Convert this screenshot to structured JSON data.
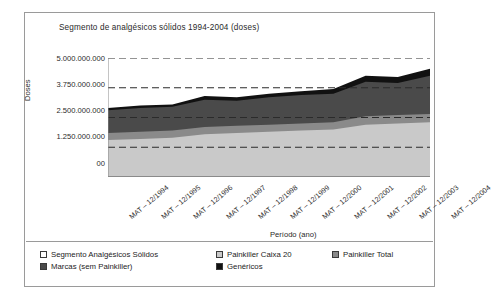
{
  "chart": {
    "title": "Segmento de analgésicos sólidos 1994-2004 (doses)",
    "y_axis_label": "Doses",
    "x_axis_label": "Período (ano)"
  },
  "legend": {
    "items": [
      {
        "label": "Segmento Analgésicos Sólidos",
        "color": "#ffffff"
      },
      {
        "label": "Painkiller Caixa 20",
        "color": "#c9c9c9"
      },
      {
        "label": "Painkiller Total",
        "color": "#8a8a8a"
      },
      {
        "label": "Marcas (sem Painkiller)",
        "color": "#4a4a4a"
      },
      {
        "label": "Genéricos",
        "color": "#111111"
      }
    ]
  },
  "chart_data": {
    "type": "area",
    "title": "Segmento de analgésicos sólidos 1994-2004 (doses)",
    "xlabel": "Período (ano)",
    "ylabel": "Doses",
    "stacked": true,
    "grid": "horizontal-dashed",
    "legend_position": "bottom",
    "ylim": [
      0,
      5000000000
    ],
    "ytick_labels": [
      "5.000.000.000",
      "3.750.000.000",
      "2.500.000.000",
      "1.250.000.000",
      "00"
    ],
    "ytick_values": [
      5000000000,
      3750000000,
      2500000000,
      1250000000,
      0
    ],
    "categories": [
      "MAT – 12/1994",
      "MAT – 12/1995",
      "MAT – 12/1996",
      "MAT – 12/1997",
      "MAT – 12/1998",
      "MAT – 12/1999",
      "MAT – 12/2000",
      "MAT – 12/2001",
      "MAT – 12/2002",
      "MAT – 12/2003",
      "MAT – 12/2004"
    ],
    "series": [
      {
        "name": "Painkiller Caixa 20",
        "color": "#c9c9c9",
        "values": [
          1550000000,
          1600000000,
          1650000000,
          1800000000,
          1850000000,
          1900000000,
          1950000000,
          2000000000,
          2200000000,
          2250000000,
          2300000000
        ]
      },
      {
        "name": "Painkiller Total",
        "color": "#8a8a8a",
        "values": [
          300000000,
          300000000,
          300000000,
          300000000,
          300000000,
          300000000,
          300000000,
          300000000,
          350000000,
          350000000,
          350000000
        ]
      },
      {
        "name": "Marcas (sem Painkiller)",
        "color": "#4a4a4a",
        "values": [
          950000000,
          1000000000,
          1000000000,
          1150000000,
          1050000000,
          1150000000,
          1200000000,
          1200000000,
          1450000000,
          1350000000,
          1600000000
        ]
      },
      {
        "name": "Genéricos",
        "color": "#111111",
        "values": [
          100000000,
          100000000,
          100000000,
          150000000,
          150000000,
          150000000,
          150000000,
          200000000,
          250000000,
          250000000,
          300000000
        ]
      }
    ],
    "totals": [
      2900000000,
      3000000000,
      3050000000,
      3400000000,
      3350000000,
      3500000000,
      3600000000,
      3700000000,
      4250000000,
      4200000000,
      4550000000
    ]
  }
}
